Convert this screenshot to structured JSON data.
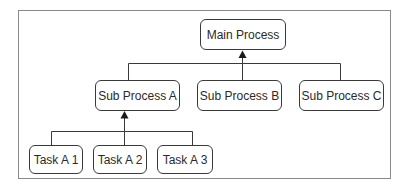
{
  "diagram": {
    "type": "hierarchy",
    "root": {
      "label": "Main Process"
    },
    "level1": [
      {
        "label": "Sub Process A"
      },
      {
        "label": "Sub Process B"
      },
      {
        "label": "Sub Process C"
      }
    ],
    "level2": [
      {
        "label": "Task A 1"
      },
      {
        "label": "Task A 2"
      },
      {
        "label": "Task A 3"
      }
    ],
    "edges": [
      {
        "from": "Sub Process A",
        "to": "Main Process"
      },
      {
        "from": "Sub Process B",
        "to": "Main Process"
      },
      {
        "from": "Sub Process C",
        "to": "Main Process"
      },
      {
        "from": "Task A 1",
        "to": "Sub Process A"
      },
      {
        "from": "Task A 2",
        "to": "Sub Process A"
      },
      {
        "from": "Task A 3",
        "to": "Sub Process A"
      }
    ],
    "colors": {
      "border": "#3a3a3a",
      "frame": "#8a8a8a",
      "text": "#2a2a2a"
    }
  }
}
